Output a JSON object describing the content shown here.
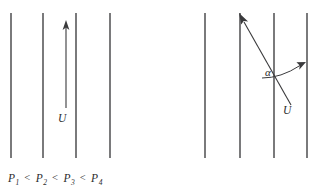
{
  "figure": {
    "background_color": "#ffffff",
    "line_color": "#3a3a3c",
    "text_color": "#2b2b2d",
    "panels": [
      {
        "id": "left",
        "description": "Flow vector U parallel to straight isobars",
        "isobar_count": 4,
        "isobar_x": [
          11,
          43,
          76,
          110
        ],
        "isobar_top": 13,
        "isobar_bottom": 158,
        "vector": {
          "label": "U",
          "direction": "up",
          "from_x": 66,
          "from_y": 108,
          "to_x": 66,
          "to_y": 25
        },
        "caption": {
          "terms": [
            "P",
            "P",
            "P",
            "P"
          ],
          "subscripts": [
            "1",
            "2",
            "3",
            "4"
          ],
          "relation": "<"
        }
      },
      {
        "id": "right",
        "description": "Flow vector U crossing isobars at angle alpha",
        "isobar_count": 4,
        "isobar_x": [
          44,
          79,
          113,
          146
        ],
        "isobar_top": 13,
        "isobar_bottom": 158,
        "vector": {
          "label": "U",
          "direction": "up-left",
          "from_x": 130,
          "from_y": 105,
          "to_x": 79,
          "to_y": 16
        },
        "angle": {
          "label": "α",
          "symbol_name": "alpha",
          "arc_from_x": 101,
          "arc_from_y": 78,
          "arc_to_x": 142,
          "arc_to_y": 64,
          "vertex_hint": "between flow vector and isobar"
        },
        "caption": {
          "terms": [
            "P",
            "P",
            "P",
            "P"
          ],
          "subscripts": [
            "1",
            "2",
            "3",
            "4"
          ],
          "relation": "<"
        }
      }
    ]
  }
}
